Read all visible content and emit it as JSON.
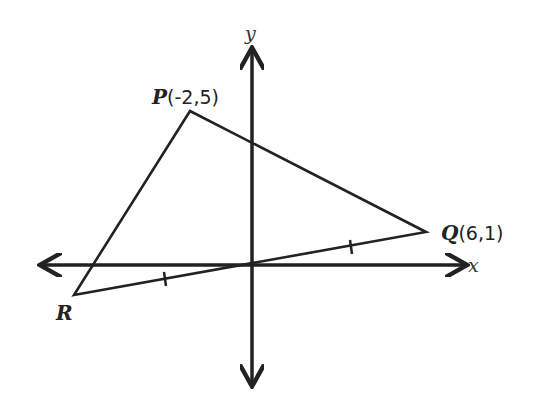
{
  "diagram": {
    "type": "coordinate-geometry",
    "axes": {
      "x_label": "x",
      "y_label": "y"
    },
    "points": {
      "P": {
        "name": "P",
        "coords_text": "(-2,5)",
        "x": -2,
        "y": 5
      },
      "Q": {
        "name": "Q",
        "coords_text": "(6,1)",
        "x": 6,
        "y": 1
      },
      "R": {
        "name": "R",
        "coords_text": ""
      }
    },
    "segments": [
      "PQ",
      "QR",
      "RP"
    ]
  }
}
